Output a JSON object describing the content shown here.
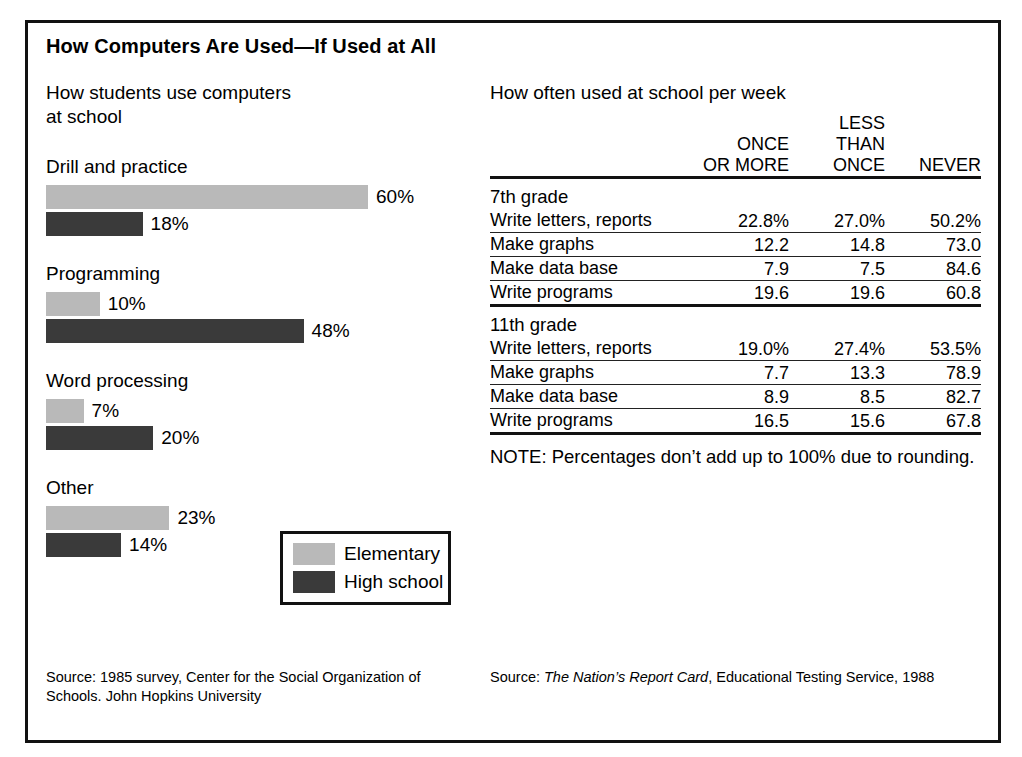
{
  "figure": {
    "title": "How Computers Are Used—If Used at All"
  },
  "left_panel": {
    "heading": "How students use computers\nat school",
    "source": "Source: 1985 survey, Center for the Social Organization of Schools. John Hopkins University",
    "legend": {
      "elementary_label": "Elementary",
      "highschool_label": "High school"
    }
  },
  "right_panel": {
    "heading": "How often used at school per week",
    "note": "NOTE: Percentages don’t add up to 100% due to rounding.",
    "source_prefix": "Source: ",
    "source_italic": "The Nation’s Report Card",
    "source_suffix": ", Educational Testing Service, 1988"
  },
  "colors": {
    "elementary": "#b9b9b9",
    "high_school": "#3a3a3a",
    "rule": "#111111",
    "background": "#ffffff"
  },
  "chart_data": [
    {
      "type": "bar",
      "title": "How students use computers at school",
      "orientation": "horizontal",
      "categories": [
        "Drill and practice",
        "Programming",
        "Word processing",
        "Other"
      ],
      "series": [
        {
          "name": "Elementary",
          "color": "#b9b9b9",
          "values": [
            60,
            10,
            7,
            23
          ],
          "labels": [
            "60%",
            "10%",
            "7%",
            "23%"
          ]
        },
        {
          "name": "High school",
          "color": "#3a3a3a",
          "values": [
            18,
            48,
            20,
            14
          ],
          "labels": [
            "18%",
            "48%",
            "20%",
            "14%"
          ]
        }
      ],
      "xlabel": "",
      "ylabel": "",
      "xlim": [
        0,
        60
      ],
      "unit": "%",
      "grid": false,
      "legend_position": "inside-bottom-right"
    },
    {
      "type": "table",
      "title": "How often used at school per week",
      "columns": [
        "",
        "ONCE\nOR MORE",
        "LESS\nTHAN\nONCE",
        "NEVER"
      ],
      "sections": [
        {
          "name": "7th grade",
          "rows": [
            {
              "label": "Write letters, reports",
              "values": [
                "22.8%",
                "27.0%",
                "50.2%"
              ]
            },
            {
              "label": "Make graphs",
              "values": [
                "12.2",
                "14.8",
                "73.0"
              ]
            },
            {
              "label": "Make data base",
              "values": [
                "7.9",
                "7.5",
                "84.6"
              ]
            },
            {
              "label": "Write programs",
              "values": [
                "19.6",
                "19.6",
                "60.8"
              ]
            }
          ]
        },
        {
          "name": "11th grade",
          "rows": [
            {
              "label": "Write letters, reports",
              "values": [
                "19.0%",
                "27.4%",
                "53.5%"
              ]
            },
            {
              "label": "Make graphs",
              "values": [
                "7.7",
                "13.3",
                "78.9"
              ]
            },
            {
              "label": "Make data base",
              "values": [
                "8.9",
                "8.5",
                "82.7"
              ]
            },
            {
              "label": "Write programs",
              "values": [
                "16.5",
                "15.6",
                "67.8"
              ]
            }
          ]
        }
      ],
      "note": "NOTE: Percentages don’t add up to 100% due to rounding."
    }
  ]
}
